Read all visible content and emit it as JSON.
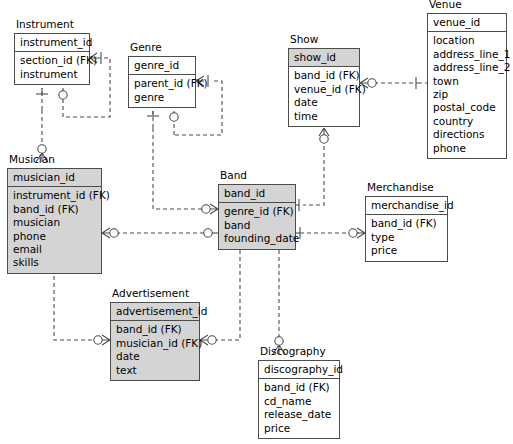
{
  "diagram": {
    "type": "entity-relationship-diagram",
    "notation": "crow's-foot",
    "background": "#ffffff",
    "line_color": "#4d4d4d",
    "shade_color": "#d4d4d4"
  },
  "entities": [
    {
      "key": "instrument",
      "title": "Instrument",
      "primary_key": "instrument_id",
      "attributes": [
        "section_id (FK)",
        "instrument"
      ],
      "shading": "none",
      "x": 14,
      "y": 33,
      "w": 76,
      "hdr": 19,
      "body": 36
    },
    {
      "key": "genre",
      "title": "Genre",
      "primary_key": "genre_id",
      "attributes": [
        "parent_id (FK)",
        "genre"
      ],
      "shading": "none",
      "x": 128,
      "y": 56,
      "w": 68,
      "hdr": 19,
      "body": 36
    },
    {
      "key": "show",
      "title": "Show",
      "primary_key": "show_id",
      "attributes": [
        "band_id (FK)",
        "venue_id (FK)",
        "date",
        "time"
      ],
      "shading": "header",
      "x": 288,
      "y": 48,
      "w": 72,
      "hdr": 19,
      "body": 61
    },
    {
      "key": "venue",
      "title": "Venue",
      "primary_key": "venue_id",
      "attributes": [
        "location",
        "address_line_1",
        "address_line_2",
        "town",
        "zip",
        "postal_code",
        "country",
        "directions",
        "phone"
      ],
      "shading": "none",
      "x": 427,
      "y": 13,
      "w": 80,
      "hdr": 19,
      "body": 128
    },
    {
      "key": "musician",
      "title": "Musician",
      "primary_key": "musician_id",
      "attributes": [
        "instrument_id (FK)",
        "band_id (FK)",
        "musician",
        "phone",
        "email",
        "skills"
      ],
      "shading": "full",
      "x": 7,
      "y": 168,
      "w": 95,
      "hdr": 19,
      "body": 88
    },
    {
      "key": "band",
      "title": "Band",
      "primary_key": "band_id",
      "attributes": [
        "genre_id (FK)",
        "band",
        "founding_date"
      ],
      "shading": "full",
      "x": 218,
      "y": 184,
      "w": 78,
      "hdr": 19,
      "body": 49
    },
    {
      "key": "merchandise",
      "title": "Merchandise",
      "primary_key": "merchandise_id",
      "attributes": [
        "band_id (FK)",
        "type",
        "price"
      ],
      "shading": "none",
      "x": 365,
      "y": 196,
      "w": 83,
      "hdr": 19,
      "body": 49
    },
    {
      "key": "advertisement",
      "title": "Advertisement",
      "primary_key": "advertisement_id",
      "attributes": [
        "band_id (FK)",
        "musician_id (FK)",
        "date",
        "text"
      ],
      "shading": "full",
      "x": 110,
      "y": 302,
      "w": 90,
      "hdr": 19,
      "body": 62
    },
    {
      "key": "discography",
      "title": "Discography",
      "primary_key": "discography_id",
      "attributes": [
        "band_id (FK)",
        "cd_name",
        "release_date",
        "price"
      ],
      "shading": "none",
      "x": 258,
      "y": 360,
      "w": 82,
      "hdr": 19,
      "body": 62
    }
  ],
  "relationships": [
    {
      "name": "instrument-self-reference",
      "from": "instrument",
      "to": "instrument",
      "from_cardinality": "one-mandatory",
      "to_cardinality": "many-optional"
    },
    {
      "name": "genre-self-reference",
      "from": "genre",
      "to": "genre",
      "from_cardinality": "one-mandatory",
      "to_cardinality": "many-optional"
    },
    {
      "name": "show-to-venue",
      "from": "show",
      "to": "venue",
      "from_cardinality": "many-optional",
      "to_cardinality": "one-mandatory"
    },
    {
      "name": "show-to-band",
      "from": "show",
      "to": "band",
      "from_cardinality": "many-optional",
      "to_cardinality": "one-mandatory"
    },
    {
      "name": "musician-to-instrument",
      "from": "musician",
      "to": "instrument",
      "from_cardinality": "many-optional",
      "to_cardinality": "one-mandatory"
    },
    {
      "name": "musician-to-band",
      "from": "musician",
      "to": "band",
      "from_cardinality": "many-optional",
      "to_cardinality": "one-optional"
    },
    {
      "name": "band-to-merchandise",
      "from": "merchandise",
      "to": "band",
      "from_cardinality": "many-optional",
      "to_cardinality": "one-mandatory"
    },
    {
      "name": "musician-to-advertisement",
      "from": "advertisement",
      "to": "musician",
      "from_cardinality": "many-optional",
      "to_cardinality": "one-optional"
    },
    {
      "name": "advertisement-to-band",
      "from": "advertisement",
      "to": "band",
      "from_cardinality": "many-optional",
      "to_cardinality": "one-mandatory"
    },
    {
      "name": "discography-to-band",
      "from": "discography",
      "to": "band",
      "from_cardinality": "many-optional",
      "to_cardinality": "one-mandatory"
    }
  ]
}
